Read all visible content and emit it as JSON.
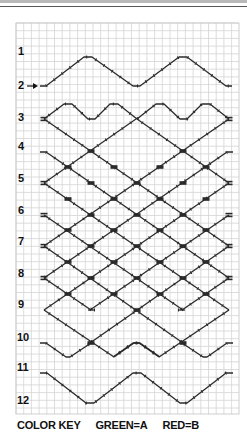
{
  "grid": {
    "x0": 16,
    "y0": 23,
    "x1": 239,
    "y1": 414,
    "cell": 7.7,
    "line_color": "#d4d4d4",
    "border_color": "#c4c4c4"
  },
  "strand_color": "#2a2a2a",
  "row_labels": [
    {
      "text": "1",
      "x": 18,
      "y": 46
    },
    {
      "text": "2",
      "x": 18,
      "y": 80
    },
    {
      "text": "3",
      "x": 18,
      "y": 112
    },
    {
      "text": "4",
      "x": 18,
      "y": 141
    },
    {
      "text": "5",
      "x": 18,
      "y": 173
    },
    {
      "text": "6",
      "x": 18,
      "y": 205
    },
    {
      "text": "7",
      "x": 18,
      "y": 236
    },
    {
      "text": "8",
      "x": 18,
      "y": 268
    },
    {
      "text": "9",
      "x": 18,
      "y": 299
    },
    {
      "text": "10",
      "x": 17,
      "y": 332
    },
    {
      "text": "11",
      "x": 17,
      "y": 362
    },
    {
      "text": "12",
      "x": 17,
      "y": 395
    }
  ],
  "start_arrow": {
    "row": "2",
    "x1": 27,
    "x2": 38,
    "y": 86
  },
  "strands": {
    "top_zigzag": [
      [
        40,
        86
      ],
      [
        46,
        86
      ],
      [
        84,
        57
      ],
      [
        92,
        57
      ],
      [
        133,
        86
      ],
      [
        140,
        86
      ],
      [
        179,
        57
      ],
      [
        187,
        57
      ],
      [
        226,
        86
      ],
      [
        232,
        86
      ]
    ],
    "row3_zigzag": [
      [
        44,
        119
      ],
      [
        64,
        104
      ],
      [
        72,
        104
      ],
      [
        88,
        119
      ],
      [
        95,
        119
      ],
      [
        110,
        104
      ],
      [
        118,
        104
      ],
      [
        137,
        119
      ],
      [
        156,
        104
      ],
      [
        164,
        104
      ],
      [
        180,
        119
      ],
      [
        187,
        119
      ],
      [
        202,
        104
      ],
      [
        210,
        104
      ],
      [
        229,
        119
      ]
    ],
    "descending": [
      [
        [
          44,
          119
        ],
        [
          229,
          246
        ]
      ],
      [
        [
          137,
          119
        ],
        [
          229,
          183
        ]
      ],
      [
        [
          40,
          152
        ],
        [
          46,
          152
        ],
        [
          229,
          278
        ]
      ],
      [
        [
          44,
          183
        ],
        [
          229,
          310
        ]
      ],
      [
        [
          44,
          215
        ],
        [
          183,
          310
        ]
      ],
      [
        [
          44,
          246
        ],
        [
          183,
          343
        ]
      ],
      [
        [
          44,
          278
        ],
        [
          91,
          310
        ]
      ],
      [
        [
          44,
          310
        ],
        [
          114,
          357
        ]
      ]
    ],
    "row10_extra": [
      [
        40,
        343
      ],
      [
        46,
        343
      ],
      [
        66,
        357
      ],
      [
        70,
        357
      ],
      [
        91,
        343
      ]
    ],
    "row10_mid": [
      [
        114,
        357
      ],
      [
        134,
        343
      ],
      [
        140,
        343
      ],
      [
        160,
        357
      ]
    ],
    "row9_flats": [
      [
        88,
        310
      ],
      [
        95,
        310
      ]
    ],
    "bottom_zigzag": [
      [
        40,
        373
      ],
      [
        47,
        373
      ],
      [
        86,
        403
      ],
      [
        94,
        403
      ],
      [
        133,
        373
      ],
      [
        141,
        373
      ],
      [
        180,
        403
      ],
      [
        187,
        403
      ],
      [
        226,
        373
      ],
      [
        233,
        373
      ]
    ]
  },
  "edge_knots": [
    [
      44,
      119
    ],
    [
      229,
      119
    ],
    [
      44,
      183
    ],
    [
      229,
      183
    ],
    [
      44,
      215
    ],
    [
      229,
      215
    ],
    [
      44,
      246
    ],
    [
      229,
      246
    ],
    [
      44,
      278
    ],
    [
      229,
      278
    ]
  ],
  "interior_knots": [
    [
      91,
      151
    ],
    [
      183,
      151
    ],
    [
      68,
      167
    ],
    [
      114,
      167
    ],
    [
      160,
      167
    ],
    [
      206,
      167
    ],
    [
      91,
      183
    ],
    [
      137,
      183
    ],
    [
      183,
      183
    ],
    [
      68,
      199
    ],
    [
      114,
      199
    ],
    [
      160,
      199
    ],
    [
      206,
      199
    ],
    [
      91,
      215
    ],
    [
      137,
      215
    ],
    [
      183,
      215
    ],
    [
      68,
      230
    ],
    [
      114,
      230
    ],
    [
      160,
      230
    ],
    [
      206,
      230
    ],
    [
      91,
      246
    ],
    [
      137,
      246
    ],
    [
      183,
      246
    ],
    [
      68,
      262
    ],
    [
      114,
      262
    ],
    [
      160,
      262
    ],
    [
      206,
      262
    ],
    [
      91,
      278
    ],
    [
      137,
      278
    ],
    [
      183,
      278
    ],
    [
      68,
      294
    ],
    [
      114,
      294
    ],
    [
      160,
      294
    ],
    [
      206,
      294
    ],
    [
      137,
      310
    ],
    [
      91,
      343
    ],
    [
      183,
      343
    ]
  ],
  "color_key": {
    "label": "COLOR KEY",
    "green": "GREEN=A",
    "red": "RED=B"
  }
}
